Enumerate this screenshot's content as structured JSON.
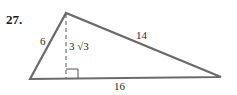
{
  "problem": {
    "number": "27."
  },
  "figure": {
    "type": "triangle",
    "labels": {
      "left_side": "6",
      "right_side": "14",
      "base": "16",
      "altitude": "3 √3"
    },
    "colors": {
      "stroke": "#6b6b6b",
      "text": "#2a2a2a"
    }
  }
}
